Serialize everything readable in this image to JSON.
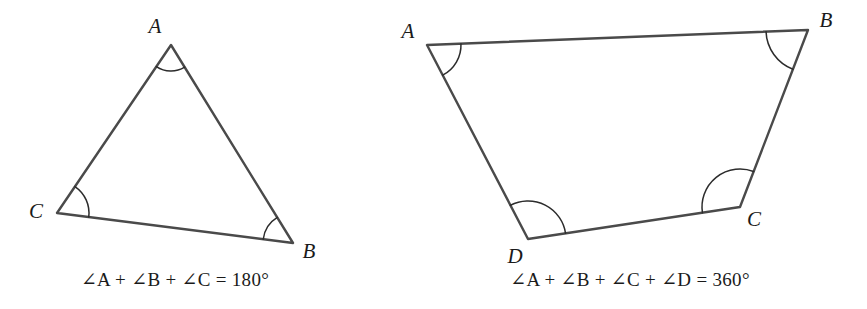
{
  "figures": [
    {
      "id": "triangle",
      "name": "triangle-figure",
      "shape": "triangle",
      "vertices": [
        {
          "label": "A",
          "x": 171,
          "y": 45,
          "label_x": 155,
          "label_y": 28
        },
        {
          "label": "B",
          "x": 293,
          "y": 243,
          "label_x": 309,
          "label_y": 253
        },
        {
          "label": "C",
          "x": 57,
          "y": 213,
          "label_x": 36,
          "label_y": 213
        }
      ],
      "angle_arcs": [
        {
          "vertex": "A",
          "radius": 26
        },
        {
          "vertex": "B",
          "radius": 30
        },
        {
          "vertex": "C",
          "radius": 32
        }
      ],
      "caption": {
        "text": "∠A + ∠B + ∠C = 180°",
        "angle_terms": [
          "A",
          "B",
          "C"
        ],
        "sum_value": "180",
        "unit": "°"
      }
    },
    {
      "id": "quadrilateral",
      "name": "quadrilateral-figure",
      "shape": "quadrilateral",
      "vertices": [
        {
          "label": "A",
          "x": 427,
          "y": 45,
          "label_x": 408,
          "label_y": 33
        },
        {
          "label": "B",
          "x": 808,
          "y": 30,
          "label_x": 826,
          "label_y": 22
        },
        {
          "label": "C",
          "x": 740,
          "y": 207,
          "label_x": 754,
          "label_y": 221
        },
        {
          "label": "D",
          "x": 528,
          "y": 239,
          "label_x": 515,
          "label_y": 258
        }
      ],
      "angle_arcs": [
        {
          "vertex": "A",
          "radius": 34
        },
        {
          "vertex": "B",
          "radius": 42
        },
        {
          "vertex": "C",
          "radius": 38
        },
        {
          "vertex": "D",
          "radius": 38
        }
      ],
      "caption": {
        "text": "∠A + ∠B + ∠C + ∠D = 360°",
        "angle_terms": [
          "A",
          "B",
          "C",
          "D"
        ],
        "sum_value": "360",
        "unit": "°"
      }
    }
  ],
  "symbols": {
    "angle": "∠",
    "plus": "+",
    "equals": "=",
    "degree": "°"
  },
  "colors": {
    "background": "#ffffff",
    "edge_stroke": "#4a4a4a",
    "arc_stroke": "#2c2c2c",
    "text": "#1a1a1a"
  }
}
